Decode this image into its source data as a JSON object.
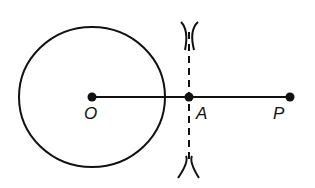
{
  "diagram": {
    "points": [
      {
        "id": "O",
        "label": "O"
      },
      {
        "id": "A",
        "label": "A"
      },
      {
        "id": "P",
        "label": "P"
      }
    ],
    "colors": {
      "stroke": "#111111",
      "background": "#ffffff"
    }
  }
}
